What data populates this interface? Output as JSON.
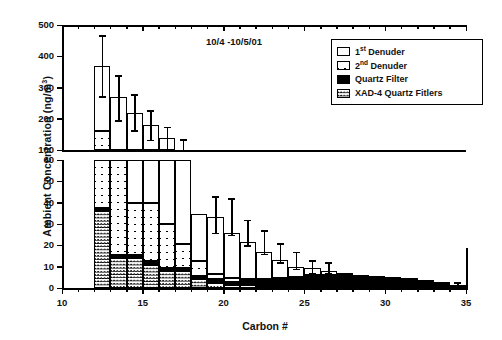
{
  "figure": {
    "annotation": "10/4 -10/5/01",
    "xlabel": "Carbon #",
    "ylabel": "Ambient Concentration (ng/m3)",
    "ylabel_parts": {
      "main": "Ambient Concentration (ng/m",
      "sup": "3",
      "tail": ")"
    }
  },
  "legend": {
    "items": [
      {
        "label_main": "1",
        "label_sup": "st",
        "label_rest": " Denuder",
        "key": "denuder1",
        "pattern": "open",
        "name": "legend-item-1st-denuder"
      },
      {
        "label_main": "2",
        "label_sup": "nd",
        "label_rest": " Denuder",
        "key": "denuder2",
        "pattern": "cross",
        "name": "legend-item-2nd-denuder"
      },
      {
        "label_main": "",
        "label_sup": "",
        "label_rest": "Quartz Filter",
        "key": "quartz",
        "pattern": "solid",
        "name": "legend-item-quartz-filter"
      },
      {
        "label_main": "",
        "label_sup": "",
        "label_rest": "XAD-4 Quartz Fitlers",
        "key": "xad4",
        "pattern": "dense",
        "name": "legend-item-xad4-quartz-filters"
      }
    ]
  },
  "chart_data": {
    "type": "bar",
    "subtype": "stacked-bar-broken-axis",
    "title": "",
    "annotation": "10/4 -10/5/01",
    "xlabel": "Carbon #",
    "ylabel": "Ambient Concentration (ng/m3)",
    "grid": false,
    "legend_position": "top-right",
    "xlim": [
      10,
      35
    ],
    "xticks": [
      10,
      15,
      20,
      25,
      30,
      35
    ],
    "xminor_step": 1,
    "upper_panel": {
      "ylim": [
        100,
        500
      ],
      "yticks": [
        100,
        200,
        300,
        400,
        500
      ]
    },
    "lower_panel": {
      "ylim": [
        0,
        60
      ],
      "yticks": [
        0,
        10,
        20,
        30,
        40,
        50,
        60
      ]
    },
    "stack_order_bottom_to_top": [
      "xad4",
      "quartz",
      "denuder2",
      "denuder1"
    ],
    "categories": [
      12,
      13,
      14,
      15,
      16,
      17,
      18,
      19,
      20,
      21,
      22,
      23,
      24,
      25,
      26,
      27,
      28,
      29,
      30,
      31,
      32,
      33,
      34
    ],
    "series": [
      {
        "name": "XAD-4 Quartz Fitlers",
        "key": "xad4",
        "values": [
          36,
          14,
          14,
          11,
          8,
          8,
          4,
          2.5,
          1.5,
          1.2,
          1.0,
          1.0,
          0.8,
          0.6,
          0.5,
          0.5,
          0.4,
          0.4,
          0.3,
          0.3,
          0.3,
          0.3,
          0.2
        ]
      },
      {
        "name": "Quartz Filter",
        "key": "quartz",
        "values": [
          1.5,
          1.5,
          1.5,
          1.5,
          1.5,
          1.5,
          1.5,
          1.5,
          1.5,
          2.0,
          2.5,
          3.0,
          4.0,
          5.0,
          5.5,
          5.5,
          5.0,
          4.8,
          4.5,
          4.0,
          3.2,
          2.2,
          1.2
        ]
      },
      {
        "name": "2nd Denuder",
        "key": "denuder2",
        "values": [
          124,
          49,
          24.5,
          27.5,
          20.5,
          11,
          7,
          2.5,
          1.5,
          1.0,
          0.8,
          0.6,
          0.5,
          0.4,
          0.3,
          0.3,
          0.2,
          0.2,
          0.2,
          0.2,
          0.2,
          0.2,
          0.1
        ]
      },
      {
        "name": "1st Denuder",
        "key": "denuder1",
        "values": [
          208,
          204,
          180,
          140,
          108,
          45,
          22,
          27,
          21.5,
          17.3,
          12.5,
          8.4,
          4.7,
          3.4,
          1.7,
          0.7,
          0.4,
          0.3,
          0.2,
          0.2,
          0.1,
          0.1,
          0.1
        ]
      }
    ],
    "totals": [
      369.5,
      268.5,
      220,
      180,
      138,
      65.5,
      34.5,
      33.5,
      26,
      21.5,
      16.8,
      13,
      10,
      9.4,
      8.0,
      7.0,
      6.0,
      5.7,
      5.2,
      4.7,
      3.8,
      2.8,
      1.6
    ],
    "error_bars": {
      "description": "Symmetric error bars on the stacked total",
      "values": [
        {
          "x": 12,
          "total": 369.5,
          "low": 272,
          "high": 468
        },
        {
          "x": 13,
          "total": 268.5,
          "low": 196,
          "high": 340
        },
        {
          "x": 14,
          "total": 220,
          "low": 163,
          "high": 278
        },
        {
          "x": 15,
          "total": 180,
          "low": 133,
          "high": 228
        },
        {
          "x": 16,
          "total": 138,
          "low": 102,
          "high": 174
        },
        {
          "x": 17,
          "total": 108,
          "low": 82,
          "high": 134
        },
        {
          "x": 18,
          "total": 65.5,
          "low": 60,
          "high": 72
        },
        {
          "x": 19,
          "total": 34.5,
          "low": 26,
          "high": 43
        },
        {
          "x": 20,
          "total": 33.5,
          "low": 25,
          "high": 42
        },
        {
          "x": 21,
          "total": 26,
          "low": 20,
          "high": 32
        },
        {
          "x": 22,
          "total": 21.5,
          "low": 16,
          "high": 27
        },
        {
          "x": 23,
          "total": 16.8,
          "low": 12,
          "high": 21
        },
        {
          "x": 24,
          "total": 13,
          "low": 9,
          "high": 17
        },
        {
          "x": 25,
          "total": 10,
          "low": 7,
          "high": 13
        },
        {
          "x": 26,
          "total": 9.4,
          "low": 7,
          "high": 12
        },
        {
          "x": 34,
          "total": 1.6,
          "low": 0.8,
          "high": 2.6
        }
      ]
    }
  }
}
